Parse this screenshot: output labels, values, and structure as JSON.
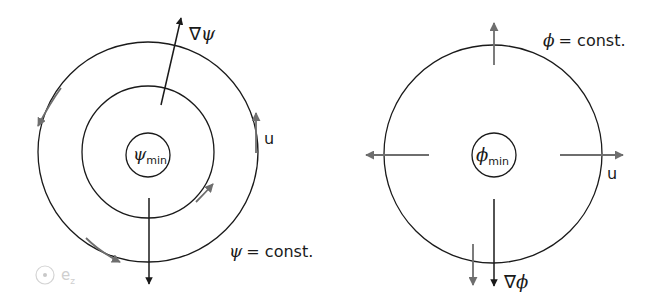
{
  "left_panel": {
    "inner_label_symbol": "ψ",
    "inner_label_sub": "min",
    "gradient_label_nabla": "∇",
    "gradient_label_symbol": "ψ",
    "velocity_label": "u",
    "contour_label_symbol": "ψ",
    "contour_label_text": "= const.",
    "axis_symbol_letter": "e",
    "axis_symbol_sub": "z"
  },
  "right_panel": {
    "inner_label_symbol": "ϕ",
    "inner_label_sub": "min",
    "gradient_label_nabla": "∇",
    "gradient_label_symbol": "ϕ",
    "velocity_label": "u",
    "contour_label_symbol": "ϕ",
    "contour_label_text": "= const."
  },
  "colors": {
    "line": "#1a1a1a",
    "velocity_arrow": "#6e6e6e",
    "faint": "#cfcfcf"
  }
}
